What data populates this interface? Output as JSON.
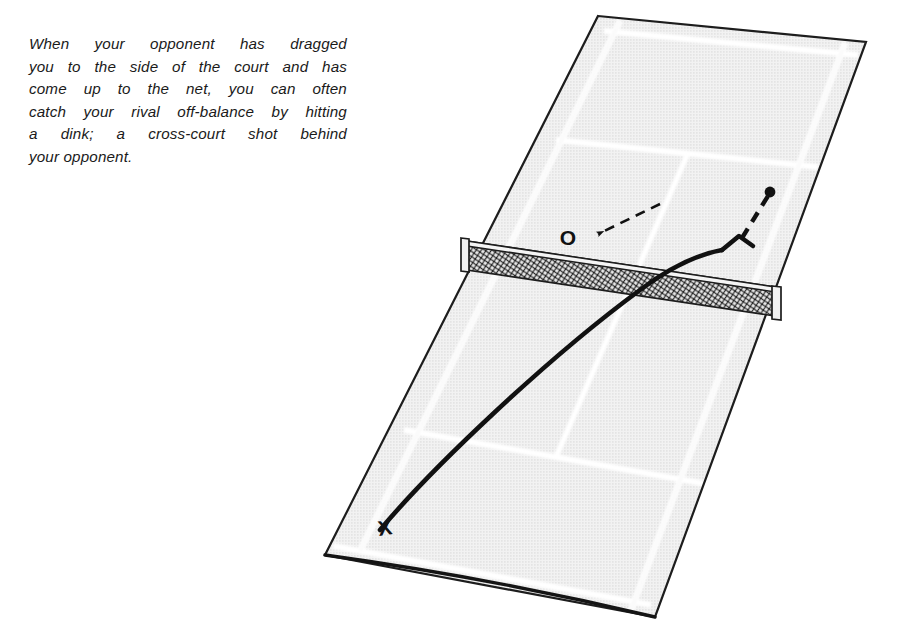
{
  "figure": {
    "caption": {
      "full_text": "When your opponent has dragged you to the side of the court and has come up to the net, you can often catch your rival off-balance by hitting a dink; a cross-court shot behind your opponent.",
      "lines": [
        "When your opponent has dragged",
        "you to the side of the court and has",
        "come up to the net, you can often",
        "catch your rival off-balance by hitting",
        "a dink; a cross-court shot behind",
        "your opponent."
      ]
    },
    "markers": {
      "player_x_label": "X",
      "opponent_o_label": "O"
    },
    "colors": {
      "court_surface": "#ededed",
      "court_line": "#ffffff",
      "court_outline": "#1a1a1a",
      "net_fill": "#b9b9b9",
      "trajectory": "#111111",
      "text": "#1a1a1a",
      "page_background": "#ffffff"
    },
    "elements": {
      "court_label": "tennis-court-perspective",
      "net_label": "tennis-net",
      "shot_path_label": "dink-shot-trajectory",
      "movement_path_label": "opponent-movement-path",
      "arrow_label": "dashed-arrow-to-opponent"
    }
  }
}
